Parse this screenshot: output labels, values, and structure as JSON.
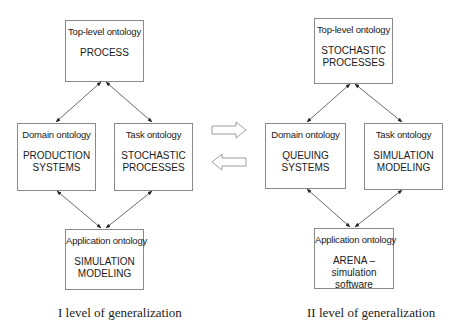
{
  "diagram": {
    "left": {
      "top": {
        "header": "Top-level ontology",
        "body": "PROCESS"
      },
      "domain": {
        "header": "Domain ontology",
        "body": "PRODUCTION\nSYSTEMS"
      },
      "task": {
        "header": "Task ontology",
        "body": "STOCHASTIC\nPROCESSES"
      },
      "app": {
        "header": "Application ontology",
        "body": "SIMULATION\nMODELING"
      },
      "caption": "I level of generalization"
    },
    "right": {
      "top": {
        "header": "Top-level ontology",
        "body": "STOCHASTIC\nPROCESSES"
      },
      "domain": {
        "header": "Domain ontology",
        "body": "QUEUING\nSYSTEMS"
      },
      "task": {
        "header": "Task ontology",
        "body": "SIMULATION\nMODELING"
      },
      "app": {
        "header": "Application ontology",
        "body": "ARENA – simulation\nsoftware"
      },
      "caption": "II level of generalization"
    },
    "connectors": {
      "forward_arrow": "right-arrow-icon",
      "backward_arrow": "left-arrow-icon"
    },
    "colors": {
      "box_border": "#8a8a8a",
      "line": "#333333",
      "text": "#1a1a1a"
    }
  }
}
